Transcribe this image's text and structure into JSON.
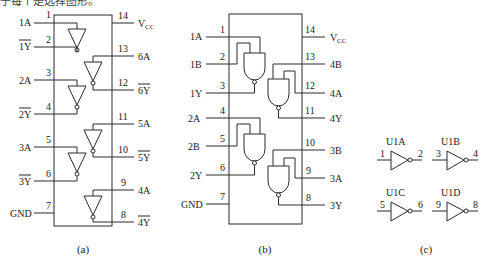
{
  "header": {
    "cut_text": "于每个是选择图形。"
  },
  "figures": {
    "a": {
      "caption": "(a)",
      "left_pins": [
        {
          "num": "1",
          "label": "1A",
          "overbar": false
        },
        {
          "num": "2",
          "label": "1Y",
          "overbar": true
        },
        {
          "num": "3",
          "label": "2A",
          "overbar": false
        },
        {
          "num": "4",
          "label": "2Y",
          "overbar": true
        },
        {
          "num": "5",
          "label": "3A",
          "overbar": false
        },
        {
          "num": "6",
          "label": "3Y",
          "overbar": true
        },
        {
          "num": "7",
          "label": "GND",
          "overbar": false
        }
      ],
      "right_pins": [
        {
          "num": "14",
          "label": "V",
          "sub": "CC",
          "overbar": false
        },
        {
          "num": "13",
          "label": "6A",
          "overbar": false
        },
        {
          "num": "12",
          "label": "6Y",
          "overbar": true
        },
        {
          "num": "11",
          "label": "5A",
          "overbar": false
        },
        {
          "num": "10",
          "label": "5Y",
          "overbar": true
        },
        {
          "num": "9",
          "label": "4A",
          "overbar": false
        },
        {
          "num": "8",
          "label": "4Y",
          "overbar": true
        }
      ]
    },
    "b": {
      "caption": "(b)",
      "left_pins": [
        {
          "num": "1",
          "label": "1A"
        },
        {
          "num": "2",
          "label": "1B"
        },
        {
          "num": "3",
          "label": "1Y"
        },
        {
          "num": "4",
          "label": "2A"
        },
        {
          "num": "5",
          "label": "2B"
        },
        {
          "num": "6",
          "label": "2Y"
        },
        {
          "num": "7",
          "label": "GND"
        }
      ],
      "right_pins": [
        {
          "num": "14",
          "label": "V",
          "sub": "CC"
        },
        {
          "num": "13",
          "label": "4B"
        },
        {
          "num": "12",
          "label": "4A"
        },
        {
          "num": "11",
          "label": "4Y"
        },
        {
          "num": "10",
          "label": "3B"
        },
        {
          "num": "9",
          "label": "3A"
        },
        {
          "num": "8",
          "label": "3Y"
        }
      ]
    },
    "c": {
      "caption": "(c)",
      "inverters": [
        {
          "name": "U1A",
          "in": "1",
          "out": "2"
        },
        {
          "name": "U1B",
          "in": "3",
          "out": "4"
        },
        {
          "name": "U1C",
          "in": "5",
          "out": "6"
        },
        {
          "name": "U1D",
          "in": "9",
          "out": "8"
        }
      ]
    }
  }
}
